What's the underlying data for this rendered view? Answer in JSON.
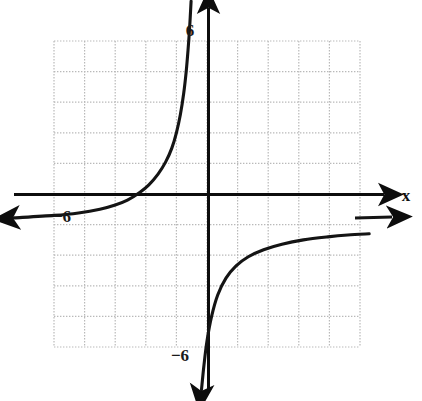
{
  "figure": {
    "kind": "coordinate-plane-graph",
    "background_color": "#ffffff",
    "axis_color": "#000000",
    "grid_color": "#b9b9b9",
    "curve_color": "#111111",
    "width": 422,
    "height": 401
  },
  "axes": {
    "x_axis_label": "x",
    "y_axis_label": "",
    "x_tick_labels": [
      {
        "text": "−6",
        "value": -6,
        "px_x": 62,
        "px_y": 215
      }
    ],
    "y_tick_labels": [
      {
        "text": "6",
        "value": 6,
        "px_x": 190,
        "px_y": 36
      },
      {
        "text": "−6",
        "value": -6,
        "px_x": 180,
        "px_y": 361
      }
    ],
    "origin_px": {
      "x": 207,
      "y": 194
    },
    "pixels_per_unit": 30.6,
    "x_range": [
      -5,
      5
    ],
    "y_range": [
      -5,
      5
    ],
    "grid": true,
    "grid_step": 1
  },
  "chart_data": {
    "type": "line",
    "title": "",
    "xlabel": "x",
    "ylabel": "",
    "xlim": [
      -5,
      5
    ],
    "ylim": [
      -5,
      5
    ],
    "grid": true,
    "legend": "none",
    "asymptotes": {
      "vertical_x": -0.4,
      "horizontal_y": -1
    },
    "series": [
      {
        "name": "upper-left-branch",
        "arrow_start": "left",
        "points": [
          {
            "x": -6.3,
            "y": -0.78
          },
          {
            "x": -5.0,
            "y": -0.7
          },
          {
            "x": -4.2,
            "y": -0.62
          },
          {
            "x": -3.5,
            "y": -0.5
          },
          {
            "x": -3.0,
            "y": -0.36
          },
          {
            "x": -2.6,
            "y": -0.2
          },
          {
            "x": -2.2,
            "y": 0.05
          },
          {
            "x": -1.9,
            "y": 0.3
          },
          {
            "x": -1.6,
            "y": 0.65
          },
          {
            "x": -1.35,
            "y": 1.05
          },
          {
            "x": -1.15,
            "y": 1.5
          },
          {
            "x": -1.0,
            "y": 2.0
          },
          {
            "x": -0.87,
            "y": 2.6
          },
          {
            "x": -0.76,
            "y": 3.3
          },
          {
            "x": -0.68,
            "y": 4.0
          },
          {
            "x": -0.62,
            "y": 4.7
          },
          {
            "x": -0.57,
            "y": 5.4
          },
          {
            "x": -0.52,
            "y": 6.3
          }
        ]
      },
      {
        "name": "lower-right-branch",
        "arrow_start": "down",
        "points": [
          {
            "x": -0.18,
            "y": -6.4
          },
          {
            "x": -0.1,
            "y": -5.6
          },
          {
            "x": 0.0,
            "y": -4.8
          },
          {
            "x": 0.15,
            "y": -4.0
          },
          {
            "x": 0.35,
            "y": -3.3
          },
          {
            "x": 0.62,
            "y": -2.75
          },
          {
            "x": 0.95,
            "y": -2.35
          },
          {
            "x": 1.35,
            "y": -2.05
          },
          {
            "x": 1.85,
            "y": -1.82
          },
          {
            "x": 2.45,
            "y": -1.64
          },
          {
            "x": 3.15,
            "y": -1.5
          },
          {
            "x": 3.95,
            "y": -1.4
          },
          {
            "x": 4.6,
            "y": -1.34
          },
          {
            "x": 5.3,
            "y": -1.3
          }
        ]
      }
    ]
  }
}
